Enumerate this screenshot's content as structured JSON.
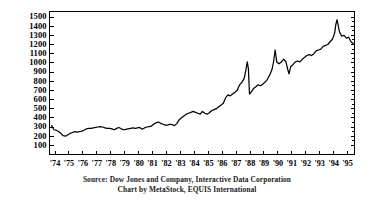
{
  "chart_data": {
    "type": "line",
    "title": "",
    "xlabel": "",
    "ylabel": "",
    "ylim": [
      0,
      1560
    ],
    "xlim": [
      1973.6,
      1995.5
    ],
    "grid": false,
    "legend_position": "none",
    "y_ticks": [
      100,
      200,
      300,
      400,
      500,
      600,
      700,
      800,
      900,
      1000,
      1100,
      1200,
      1300,
      1400,
      1500
    ],
    "y_tick_labels": [
      "100",
      "200",
      "300",
      "400",
      "500",
      "600",
      "700",
      "800",
      "900",
      "1000",
      "1100",
      "1200",
      "1300",
      "1400",
      "1500"
    ],
    "x_ticks": [
      1974,
      1975,
      1976,
      1977,
      1978,
      1979,
      1980,
      1981,
      1982,
      1983,
      1984,
      1985,
      1986,
      1987,
      1988,
      1989,
      1990,
      1991,
      1992,
      1993,
      1994,
      1995
    ],
    "x_tick_labels": [
      "'74",
      "'75",
      "'76",
      "'77",
      "'78",
      "'79",
      "'80",
      "'81",
      "'82",
      "'83",
      "'84",
      "'85",
      "'86",
      "'87",
      "'88",
      "'89",
      "'90",
      "'91",
      "'92",
      "'93",
      "'94",
      "'95"
    ],
    "series": [
      {
        "name": "S&P 500 Index",
        "color": "#000000",
        "x": [
          1973.75,
          1973.92,
          1974.08,
          1974.25,
          1974.42,
          1974.58,
          1974.75,
          1974.92,
          1975.08,
          1975.25,
          1975.42,
          1975.58,
          1975.75,
          1975.92,
          1976.08,
          1976.25,
          1976.42,
          1976.58,
          1976.75,
          1976.92,
          1977.08,
          1977.25,
          1977.42,
          1977.58,
          1977.75,
          1977.92,
          1978.08,
          1978.25,
          1978.42,
          1978.58,
          1978.75,
          1978.92,
          1979.08,
          1979.25,
          1979.42,
          1979.58,
          1979.75,
          1979.92,
          1980.08,
          1980.25,
          1980.42,
          1980.58,
          1980.75,
          1980.92,
          1981.08,
          1981.25,
          1981.42,
          1981.58,
          1981.75,
          1981.92,
          1982.08,
          1982.25,
          1982.42,
          1982.58,
          1982.75,
          1982.92,
          1983.08,
          1983.25,
          1983.42,
          1983.58,
          1983.75,
          1983.92,
          1984.08,
          1984.25,
          1984.42,
          1984.58,
          1984.75,
          1984.92,
          1985.08,
          1985.25,
          1985.42,
          1985.58,
          1985.75,
          1985.92,
          1986.08,
          1986.25,
          1986.42,
          1986.58,
          1986.75,
          1986.92,
          1987.08,
          1987.25,
          1987.42,
          1987.58,
          1987.7,
          1987.8,
          1987.88,
          1987.96,
          1988.08,
          1988.25,
          1988.42,
          1988.58,
          1988.75,
          1988.92,
          1989.08,
          1989.25,
          1989.42,
          1989.58,
          1989.7,
          1989.8,
          1989.92,
          1990.08,
          1990.25,
          1990.42,
          1990.58,
          1990.7,
          1990.8,
          1990.92,
          1991.08,
          1991.25,
          1991.42,
          1991.58,
          1991.75,
          1991.92,
          1992.08,
          1992.25,
          1992.42,
          1992.58,
          1992.75,
          1992.92,
          1993.08,
          1993.25,
          1993.42,
          1993.58,
          1993.75,
          1993.92,
          1994.0,
          1994.08,
          1994.16,
          1994.25,
          1994.42,
          1994.58,
          1994.75,
          1994.92,
          1995.08,
          1995.25,
          1995.4
        ],
        "values": [
          315,
          270,
          265,
          250,
          230,
          205,
          200,
          215,
          230,
          240,
          250,
          245,
          250,
          255,
          265,
          280,
          285,
          285,
          290,
          295,
          300,
          305,
          300,
          290,
          285,
          285,
          280,
          270,
          285,
          295,
          280,
          270,
          275,
          280,
          285,
          290,
          285,
          290,
          295,
          275,
          290,
          300,
          305,
          310,
          330,
          345,
          355,
          340,
          330,
          320,
          320,
          330,
          325,
          315,
          340,
          380,
          400,
          420,
          440,
          450,
          460,
          470,
          460,
          450,
          440,
          470,
          450,
          440,
          455,
          480,
          490,
          500,
          520,
          540,
          560,
          620,
          650,
          640,
          660,
          680,
          700,
          760,
          790,
          830,
          920,
          1010,
          940,
          660,
          680,
          720,
          740,
          760,
          750,
          770,
          790,
          820,
          870,
          930,
          1020,
          1140,
          1010,
          990,
          1010,
          1040,
          1010,
          930,
          880,
          960,
          980,
          1010,
          1020,
          1010,
          1040,
          1060,
          1080,
          1090,
          1080,
          1100,
          1130,
          1140,
          1150,
          1180,
          1190,
          1200,
          1230,
          1260,
          1290,
          1330,
          1420,
          1470,
          1340,
          1290,
          1300,
          1270,
          1280,
          1230,
          1210
        ]
      }
    ]
  },
  "captions": {
    "line1": "Source: Dow Jones and Company, Interactive Data Corporation",
    "line2": "Chart by MetaStock, EQUIS International"
  },
  "colors": {
    "line": "#000000",
    "axis": "#000000",
    "background": "#ffffff"
  }
}
